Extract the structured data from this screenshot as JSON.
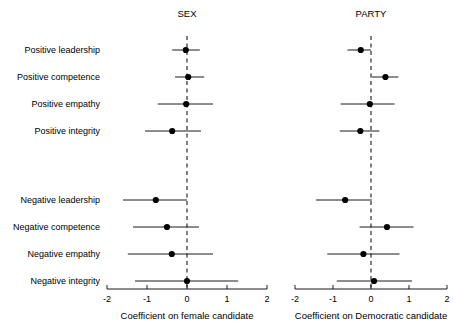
{
  "figure": {
    "width": 454,
    "height": 334,
    "background": "#ffffff",
    "foreground": "#000000"
  },
  "rows": [
    "Positive leadership",
    "Positive competence",
    "Positive empathy",
    "Positive integrity",
    "",
    "Negative leadership",
    "Negative competence",
    "Negative empathy",
    "Negative integrity"
  ],
  "chart_data": [
    {
      "type": "scatter",
      "title": "SEX",
      "xlabel": "Coefficient on female candidate",
      "ylabel": "",
      "xlim": [
        -2,
        2
      ],
      "xticks": [
        -2,
        -1,
        0,
        1,
        2
      ],
      "xticklabels": [
        "-2",
        "-1",
        "0",
        "1",
        "2"
      ],
      "grid": false,
      "reference_line": 0,
      "reference_line_style": "dashed",
      "categories": [
        "Positive leadership",
        "Positive competence",
        "Positive empathy",
        "Positive integrity",
        "Negative leadership",
        "Negative competence",
        "Negative empathy",
        "Negative integrity"
      ],
      "estimates": [
        -0.03,
        0.03,
        -0.02,
        -0.37,
        -0.78,
        -0.5,
        -0.38,
        0.0
      ],
      "ci_low": [
        -0.37,
        -0.3,
        -0.73,
        -1.05,
        -1.6,
        -1.35,
        -1.48,
        -1.3
      ],
      "ci_high": [
        0.32,
        0.43,
        0.65,
        0.35,
        0.0,
        0.3,
        0.65,
        1.28
      ]
    },
    {
      "type": "scatter",
      "title": "PARTY",
      "xlabel": "Coefficient on Democratic candidate",
      "ylabel": "",
      "xlim": [
        -2,
        2
      ],
      "xticks": [
        -2,
        -1,
        0,
        1,
        2
      ],
      "xticklabels": [
        "-2",
        "-1",
        "0",
        "1",
        "2"
      ],
      "grid": false,
      "reference_line": 0,
      "reference_line_style": "dashed",
      "categories": [
        "Positive leadership",
        "Positive competence",
        "Positive empathy",
        "Positive integrity",
        "Negative leadership",
        "Negative competence",
        "Negative empathy",
        "Negative integrity"
      ],
      "estimates": [
        -0.27,
        0.38,
        -0.03,
        -0.28,
        -0.68,
        0.42,
        -0.2,
        0.08
      ],
      "ci_low": [
        -0.62,
        0.02,
        -0.8,
        -0.82,
        -1.45,
        -0.3,
        -1.15,
        -0.9
      ],
      "ci_high": [
        0.0,
        0.72,
        0.62,
        0.22,
        0.02,
        1.12,
        0.75,
        1.08
      ]
    }
  ],
  "layout": {
    "row_y": [
      50,
      77,
      104,
      131,
      0,
      200,
      227,
      254,
      281
    ],
    "panels": [
      {
        "x0": 107,
        "x1": 267,
        "title_x": 187,
        "title_y": 17,
        "axis_y": 289,
        "ticklabel_y": 302,
        "axistitle_y": 319
      },
      {
        "x0": 295,
        "x1": 447,
        "title_x": 371,
        "title_y": 17,
        "axis_y": 289,
        "ticklabel_y": 302,
        "axistitle_y": 319
      }
    ],
    "label_x": 100,
    "point_radius": 3.1
  }
}
